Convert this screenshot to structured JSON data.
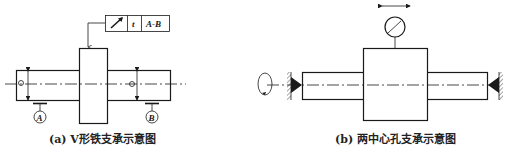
{
  "figure_a": {
    "caption": "(a) V形铁支承示意图",
    "tolerance_frame": {
      "symbol": "circular-runout-arrow",
      "tolerance": "t",
      "datum": "A-B"
    },
    "datum_labels": [
      "A",
      "B"
    ]
  },
  "figure_b": {
    "caption": "(b) 两中心孔支承示意图",
    "indicator": "dial-gauge",
    "supports": [
      "left-center",
      "right-center"
    ],
    "rotation": "rotation-arrow"
  },
  "colors": {
    "line": "#1a1a1a",
    "background": "#ffffff"
  }
}
